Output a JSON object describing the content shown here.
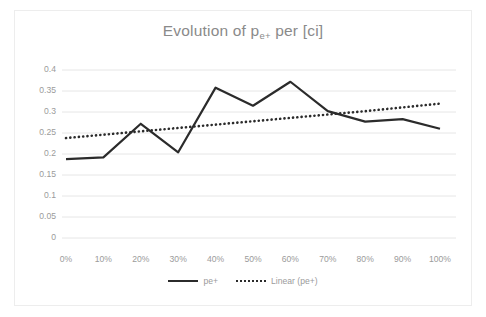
{
  "chart_data": {
    "type": "line",
    "title": "Evolution of p",
    "title_sub": "e+",
    "title_tail": " per [ci]",
    "title_full": "Evolution of pe+ per [ci]",
    "xlabel": "",
    "ylabel": "",
    "categories": [
      "0%",
      "10%",
      "20%",
      "30%",
      "40%",
      "50%",
      "60%",
      "70%",
      "80%",
      "90%",
      "100%"
    ],
    "x_values": [
      0,
      10,
      20,
      30,
      40,
      50,
      60,
      70,
      80,
      90,
      100
    ],
    "ylim": [
      0,
      0.4
    ],
    "yticks": [
      "0",
      "0.05",
      "0.1",
      "0.15",
      "0.2",
      "0.25",
      "0.3",
      "0.35",
      "0.4"
    ],
    "ytick_values": [
      0,
      0.05,
      0.1,
      0.15,
      0.2,
      0.25,
      0.3,
      0.35,
      0.4
    ],
    "grid": true,
    "legend_position": "bottom",
    "series": [
      {
        "name": "pe+",
        "style": "solid",
        "color": "#2b2b2b",
        "values": [
          0.188,
          0.192,
          0.272,
          0.204,
          0.358,
          0.315,
          0.372,
          0.302,
          0.277,
          0.283,
          0.26
        ]
      },
      {
        "name": "Linear (pe+)",
        "style": "dotted",
        "color": "#2b2b2b",
        "values": [
          0.238,
          0.246,
          0.254,
          0.262,
          0.27,
          0.278,
          0.286,
          0.294,
          0.302,
          0.311,
          0.32
        ]
      }
    ]
  },
  "legend": {
    "entries": [
      {
        "label": "pe+",
        "style": "solid"
      },
      {
        "label": "Linear (pe+)",
        "style": "dotted"
      }
    ]
  },
  "colors": {
    "series_line": "#2b2b2b",
    "grid": "#e6e6e6",
    "text": "#9b9b9b",
    "title_text": "#8a8a8a",
    "frame": "#ededed",
    "background": "#ffffff"
  }
}
